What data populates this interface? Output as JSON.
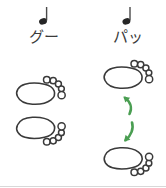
{
  "figure": {
    "title": "",
    "background_color": "#ffffff",
    "width": 166,
    "height": 188
  },
  "columns": [
    {
      "id": "left",
      "label": "グー",
      "note": {
        "glyph": "quarter-note",
        "name": "quarter-note-icon",
        "color": "#262626"
      },
      "feet": [
        {
          "position": "top",
          "orientation": "toes-up-right",
          "toe_count": 5
        },
        {
          "position": "bottom",
          "orientation": "toes-down-right",
          "toe_count": 5
        }
      ],
      "feet_state": "together",
      "arrows": []
    },
    {
      "id": "right",
      "label": "パッ",
      "note": {
        "glyph": "quarter-note",
        "name": "quarter-note-icon",
        "color": "#262626"
      },
      "feet": [
        {
          "position": "top",
          "orientation": "toes-up-right",
          "toe_count": 5
        },
        {
          "position": "bottom",
          "orientation": "toes-down-right",
          "toe_count": 5
        }
      ],
      "feet_state": "apart",
      "arrows": [
        {
          "direction": "up",
          "color": "#4a9e52",
          "name": "arrow-up-icon"
        },
        {
          "direction": "down",
          "color": "#4a9e52",
          "name": "arrow-down-icon"
        }
      ]
    }
  ],
  "colors": {
    "outline": "#3a3a3a",
    "note": "#262626",
    "text": "#3b3b3b",
    "arrow_green": "#4a9e52",
    "baseline": "#d8d8d8"
  }
}
